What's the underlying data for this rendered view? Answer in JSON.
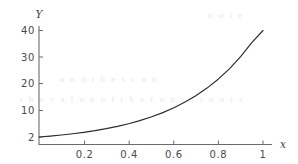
{
  "figure": {
    "background_color": "#ffffff",
    "axis_color": "#6b6b6b",
    "curve_color": "#2b2b2b",
    "label_color": "#4a4a4a"
  },
  "chart_data": {
    "type": "line",
    "title": "",
    "subtitle": "",
    "xlabel": "x",
    "ylabel": "Y",
    "grid": false,
    "legend": null,
    "legend_position": "none",
    "xlim": [
      0,
      1.05
    ],
    "ylim": [
      0,
      41
    ],
    "xticks": [
      0.2,
      0.4,
      0.6,
      0.8,
      1
    ],
    "xtick_labels": [
      "0.2",
      "0.4",
      "0.6",
      "0.8",
      "1"
    ],
    "yticks": [
      2,
      10,
      20,
      30,
      40
    ],
    "ytick_labels": [
      "2",
      "10",
      "20",
      "30",
      "40"
    ],
    "series": [
      {
        "name": "curve",
        "color": "#2b2b2b",
        "x": [
          0.0,
          0.05,
          0.1,
          0.15,
          0.2,
          0.25,
          0.3,
          0.35,
          0.4,
          0.45,
          0.5,
          0.55,
          0.6,
          0.65,
          0.7,
          0.75,
          0.8,
          0.85,
          0.9,
          0.95,
          1.0
        ],
        "y": [
          2.0,
          2.33,
          2.71,
          3.15,
          3.67,
          4.27,
          4.97,
          5.78,
          6.73,
          7.83,
          9.11,
          10.6,
          12.34,
          14.36,
          16.71,
          19.45,
          22.63,
          26.33,
          30.65,
          35.67,
          40.0
        ]
      }
    ],
    "annotations": []
  },
  "axis_labels": {
    "y_axis_name": "Y",
    "x_axis_name": "x"
  },
  "ghost_artifacts": [
    {
      "text": "a n d   t h e   s c a n",
      "x": 60,
      "y": 80
    },
    {
      "text": "t h e   v a l u e   o f   t h e   f u n c t i o n   i s",
      "x": 20,
      "y": 100
    },
    {
      "text": "n o t e",
      "x": 208,
      "y": 16
    }
  ]
}
